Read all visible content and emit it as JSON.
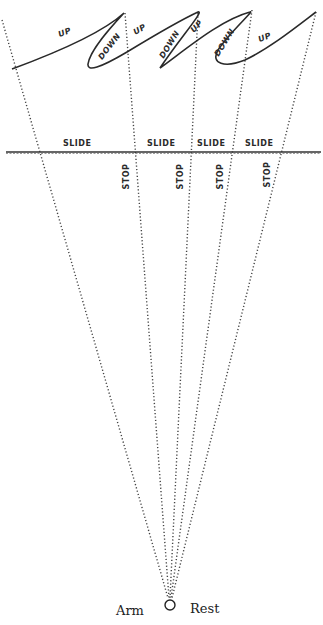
{
  "diagram": {
    "curve_labels": [
      {
        "text": "UP",
        "x": 58,
        "y": 31,
        "rot": -22
      },
      {
        "text": "DOWN",
        "x": 98,
        "y": 45,
        "rot": -52
      },
      {
        "text": "UP",
        "x": 132,
        "y": 27,
        "rot": -30
      },
      {
        "text": "DOWN",
        "x": 158,
        "y": 43,
        "rot": -58
      },
      {
        "text": "UP",
        "x": 190,
        "y": 24,
        "rot": -40
      },
      {
        "text": "DOWN",
        "x": 213,
        "y": 40,
        "rot": -58
      },
      {
        "text": "UP",
        "x": 257,
        "y": 37,
        "rot": -22
      }
    ],
    "slide_labels": [
      "SLIDE",
      "SLIDE",
      "SLIDE",
      "SLIDE"
    ],
    "stop_labels": [
      "STOP",
      "STOP",
      "STOP",
      "STOP"
    ],
    "bottom": {
      "left_label": "Arm",
      "circle": "O",
      "right_label": "Rest"
    },
    "colors": {
      "ink": "#2a2a2a",
      "dots": "#444444",
      "background": "#ffffff"
    }
  }
}
